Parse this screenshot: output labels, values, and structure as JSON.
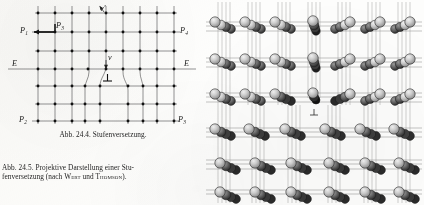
{
  "figure_edge_dislocation": {
    "id": "abb-24-4",
    "title": "Stufenversetzung",
    "labels": {
      "p1": "P",
      "p1_sub": "1",
      "p2": "P",
      "p2_sub": "2",
      "p3": "P",
      "p3_sub": "3",
      "p4": "P",
      "p4_sub": "4",
      "burgers_label": "P",
      "burgers_sub": "3",
      "slip_plane_left": "E",
      "slip_plane_right": "E",
      "vector_v": "v",
      "vector_v_prime": "v′",
      "dislocation_symbol": "⊥"
    },
    "lattice": {
      "rows_above_slip_plane": 4,
      "rows_below_slip_plane": 3,
      "columns_upper": 9,
      "columns_lower": 8,
      "extra_half_plane": true,
      "atom_color": "#111111",
      "bond_color": "#3a3a3a"
    }
  },
  "figure_projective": {
    "id": "abb-24-5",
    "title": "Projektive Darstellung einer Stufenversetzung",
    "attribution": "nach WERT und THOMSON",
    "labels": {
      "dislocation_symbol": "⊥"
    },
    "lattice": {
      "rows": 6,
      "columns_upper": 7,
      "columns_lower": 6,
      "depth_spheres": 4,
      "sphere_fill": "#c9c9c9",
      "sphere_stroke": "#1c1c1c",
      "rod_color": "#6e6e6e"
    }
  },
  "captions": {
    "caption_1": "Abb. 24.4. Stufenversetzung.",
    "caption_2_line1": "Abb. 24.5. Projektive Darstellung einer Stu-",
    "caption_2_line2_pre": "fenversetzung  (nach ",
    "caption_2_name1": "Wert",
    "caption_2_mid": " und ",
    "caption_2_name2": "Thomson",
    "caption_2_post": ")."
  },
  "page": {
    "background_color": "#fdfdfc",
    "ink_color": "#1a1a1a"
  }
}
